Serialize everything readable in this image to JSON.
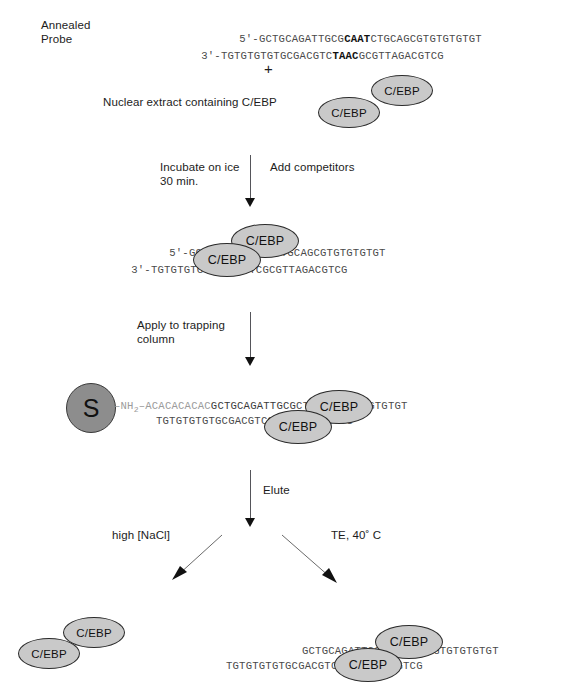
{
  "figure": {
    "top_cut_title": "",
    "protein_label": "C/EBP",
    "bead_label": "S"
  },
  "steps": {
    "annealed_probe_label": "Annealed\nProbe",
    "plus_symbol": "+",
    "nuclear_extract_label": "Nuclear extract containing C/EBP",
    "incubate_label": "Incubate on ice\n30 min.",
    "add_competitors_label": "Add competitors",
    "apply_column_label": "Apply to trapping\ncolumn",
    "elute_label": "Elute",
    "left_branch_label": "high [NaCl]",
    "right_branch_label": "TE, 40˚ C"
  },
  "sequences": {
    "probe_top_prefix": "5'-",
    "probe_top_a": "GCTGCAGATTGCG",
    "probe_top_core": "CAAT",
    "probe_top_b": "CTGCAGCGTGTGTGTGT",
    "probe_bottom_prefix": "3'-",
    "probe_bottom_a": "TGTGTGTGTGCGACGTC",
    "probe_bottom_core": "TAAC",
    "probe_bottom_b": "GCGTTAGACGTCG",
    "bound_top_prefix": "5'-",
    "bound_top_a": "GCTGCAGATTGCG",
    "bound_top_b": "CTGCAGCGTGTGTGTGT",
    "bound_bottom_prefix": "3'-",
    "bound_bottom_a": "TGTGTGTGTGCGACGTC",
    "bound_bottom_b": "GCGTTAGACGTCG",
    "linker_nh2": "–NH",
    "linker_nh2_sub": "2",
    "linker_dash": "–",
    "linker_tail": "ACACACACAC",
    "column_top_a": "GCTGCAGATTGCG",
    "column_top_b": "CTGCAGCGTGTGTGTGT",
    "column_bottom_a": "TGTGTGTGTGCGACGTC",
    "column_bottom_b": "GCGTTAGACGTCG",
    "product_top_a": "GCTGCAGATTGCG",
    "product_top_b": "CTGCAGCGTGTGTGTGT",
    "product_bottom_a": "TGTGTGTGTGCGACGTC",
    "product_bottom_b": "GCGTTAGACGTCG"
  },
  "colors": {
    "protein_fill": "#c9c9c9",
    "protein_stroke": "#2b2b2b",
    "bead_fill": "#8d8d8d",
    "sequence_text": "#4a4a4a",
    "label_text": "#1c1c1c",
    "arrow": "#55555a"
  }
}
